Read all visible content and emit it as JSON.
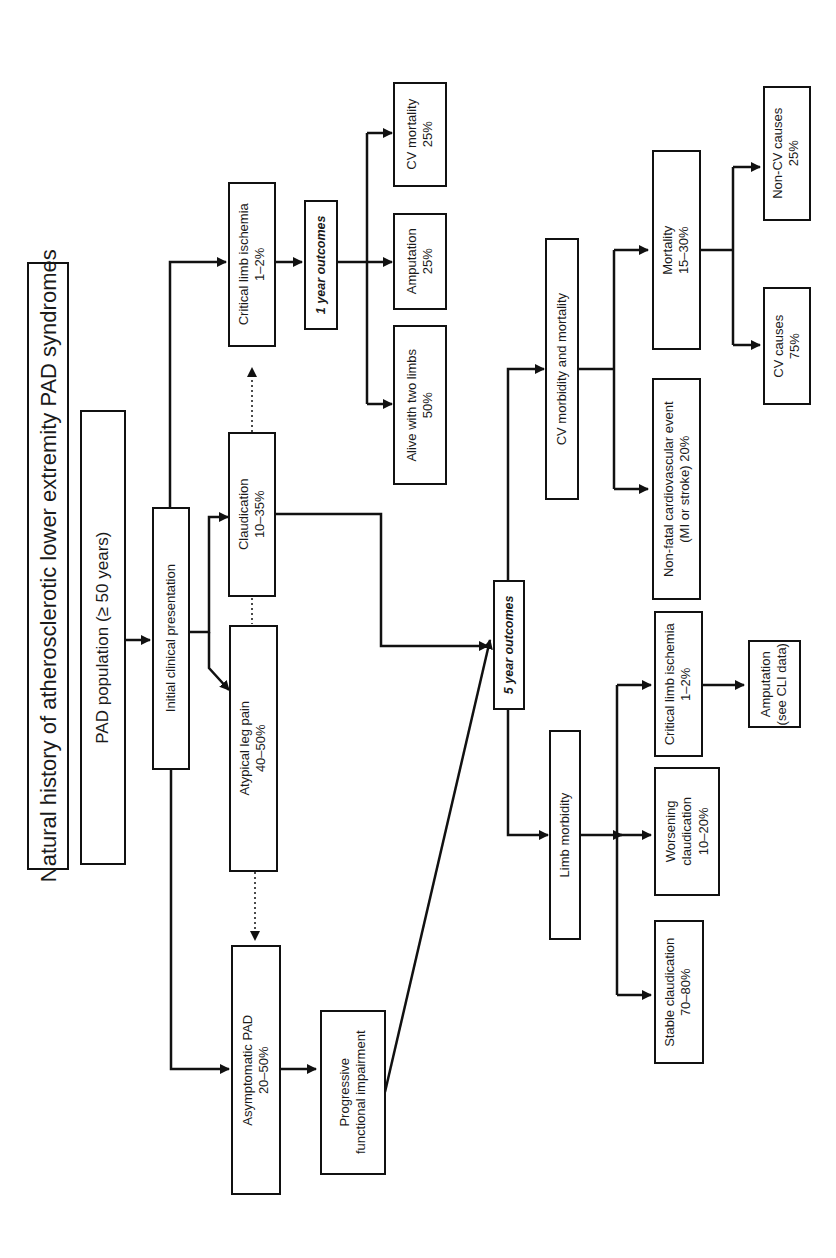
{
  "diagram": {
    "title": "Natural history of atherosclerotic lower extremity PAD syndromes",
    "orientation": "rotated 90° counterclockwise",
    "nodes": {
      "population": "PAD population (≥ 50 years)",
      "initial": "Initial clinical presentation",
      "asymptomatic": {
        "label": "Asymptomatic PAD",
        "value": "20–50%"
      },
      "atypical": {
        "label": "Atypical leg pain",
        "value": "40–50%"
      },
      "claudication": {
        "label": "Claudication",
        "value": "10–35%"
      },
      "cli": {
        "label": "Critical limb ischemia",
        "value": "1–2%"
      },
      "one_year": "1 year outcomes",
      "alive": {
        "label": "Alive with two limbs",
        "value": "50%"
      },
      "amputation1": {
        "label": "Amputation",
        "value": "25%"
      },
      "cvmort1": {
        "label": "CV mortality",
        "value": "25%"
      },
      "progressive": {
        "label": "Progressive",
        "label2": "functional impairment"
      },
      "five_year": "5 year outcomes",
      "limb_morbidity": "Limb morbidity",
      "cv_morb_mort": "CV morbidity and mortality",
      "stable": {
        "label": "Stable claudication",
        "value": "70–80%"
      },
      "worsening": {
        "label": "Worsening",
        "label2": "claudication",
        "value": "10–20%"
      },
      "cli5": {
        "label": "Critical limb ischemia",
        "value": "1–2%"
      },
      "amputation5": {
        "label": "Amputation",
        "value": "(see CLI data)"
      },
      "nonfatal": {
        "label": "Non-fatal cardiovascular event",
        "value": "(MI or stroke) 20%"
      },
      "mortality": {
        "label": "Mortality",
        "value": "15–30%"
      },
      "cvcauses": {
        "label": "CV causes",
        "value": "75%"
      },
      "noncvcauses": {
        "label": "Non-CV causes",
        "value": "25%"
      }
    },
    "colors": {
      "line": "#111111",
      "background": "#ffffff"
    }
  }
}
